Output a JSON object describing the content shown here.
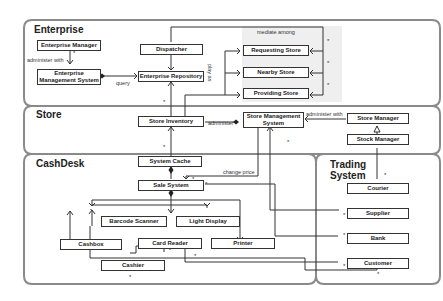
{
  "packages": {
    "enterprise": "Enterprise",
    "store": "Store",
    "cashdesk": "CashDesk",
    "trading_system": "Trading System"
  },
  "classes": {
    "enterprise_manager": "Enterprise Manager",
    "enterprise_management_system": "Enterprise Management System",
    "dispatcher": "Dispatcher",
    "enterprise_repository": "Enterprise Repository",
    "requesting_store": "Requesting Store",
    "nearby_store": "Nearby Store",
    "providing_store": "Providing Store",
    "store_inventory": "Store Inventory",
    "store_management_system": "Store Management System",
    "store_manager": "Store Manager",
    "stock_manager": "Stock Manager",
    "system_cache": "System Cache",
    "sale_system": "Sale System",
    "barcode_scanner": "Barcode Scanner",
    "light_display": "Light Display",
    "cashbox": "Cashbox",
    "card_reader": "Card Reader",
    "printer": "Printer",
    "cashier": "Cashier",
    "courier": "Courier",
    "supplier": "Supplier",
    "bank": "Bank",
    "customer": "Customer"
  },
  "labels": {
    "administer_with_1": "administer with",
    "query": "query",
    "mediate_among": "mediate among",
    "play_as": "play as",
    "administer": "administer",
    "administer_with_2": "administer with",
    "change_price": "change price"
  },
  "multiplicity": "*"
}
